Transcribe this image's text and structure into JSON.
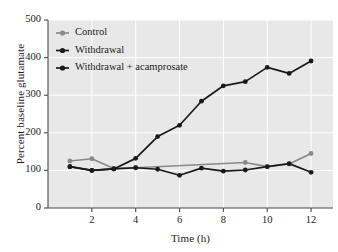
{
  "chart_data": {
    "type": "line",
    "title": "",
    "xlabel": "Time (h)",
    "ylabel": "Percent baseline glutamate",
    "xlim": [
      0,
      13
    ],
    "ylim": [
      0,
      500
    ],
    "xticks": [
      2,
      4,
      6,
      8,
      10,
      12
    ],
    "yticks": [
      0,
      100,
      200,
      300,
      400,
      500
    ],
    "grid": true,
    "legend_position": "upper left",
    "x": [
      1,
      2,
      3,
      4,
      5,
      6,
      7,
      8,
      9,
      10,
      11,
      12
    ],
    "series": [
      {
        "name": "Control",
        "color": "#8a8a8a",
        "marker": "circle",
        "x": [
          1,
          2,
          3,
          4,
          9,
          10,
          11,
          12
        ],
        "values": [
          125,
          131,
          105,
          107,
          121,
          110,
          117,
          145
        ]
      },
      {
        "name": "Withdrawal",
        "color": "#1a1a1a",
        "marker": "circle",
        "x": [
          1,
          2,
          3,
          4,
          5,
          6,
          7,
          8,
          9,
          10,
          11,
          12
        ],
        "values": [
          110,
          100,
          104,
          132,
          190,
          220,
          284,
          325,
          336,
          374,
          358,
          391
        ]
      },
      {
        "name": "Withdrawal + acamprosate",
        "color": "#1a1a1a",
        "marker": "circle",
        "x": [
          1,
          2,
          3,
          4,
          5,
          6,
          7,
          8,
          9,
          10,
          11,
          12
        ],
        "values": [
          110,
          100,
          104,
          107,
          103,
          87,
          106,
          98,
          101,
          110,
          118,
          95
        ]
      }
    ]
  },
  "legend": {
    "items": [
      {
        "label": "Control"
      },
      {
        "label": "Withdrawal"
      },
      {
        "label": "Withdrawal + acamprosate"
      }
    ]
  },
  "axes": {
    "y_title": "Percent baseline glutamate",
    "x_title": "Time (h)",
    "y_tick_labels": [
      "500",
      "400",
      "300",
      "200",
      "100",
      "0"
    ],
    "x_tick_labels": [
      "2",
      "4",
      "6",
      "8",
      "10",
      "12"
    ]
  },
  "colors": {
    "plot_background": "#e8e8e8",
    "gridline": "#ffffff",
    "axis": "#4a4a4a",
    "control_series": "#8a8a8a",
    "withdrawal_series": "#1a1a1a",
    "acamprosate_series": "#1a1a1a",
    "text": "#1c1c1c"
  }
}
